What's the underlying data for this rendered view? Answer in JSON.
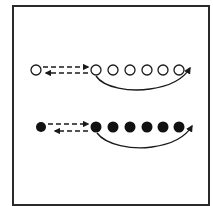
{
  "diagram": {
    "type": "drill-diagram",
    "rows": [
      {
        "name": "hollow-row",
        "style": "hollow",
        "leader": {
          "cx": 36,
          "cy": 70
        },
        "line": [
          {
            "cx": 96,
            "cy": 70
          },
          {
            "cx": 113,
            "cy": 70
          },
          {
            "cx": 130,
            "cy": 70
          },
          {
            "cx": 147,
            "cy": 70
          },
          {
            "cx": 163,
            "cy": 70
          },
          {
            "cx": 179,
            "cy": 70
          }
        ],
        "pass_arrows": "dashed-two-way",
        "run_arrow": "curved-return-to-end"
      },
      {
        "name": "filled-row",
        "style": "filled",
        "leader": {
          "cx": 41,
          "cy": 127
        },
        "line": [
          {
            "cx": 96,
            "cy": 127
          },
          {
            "cx": 113,
            "cy": 127
          },
          {
            "cx": 130,
            "cy": 127
          },
          {
            "cx": 147,
            "cy": 127
          },
          {
            "cx": 163,
            "cy": 127
          },
          {
            "cx": 179,
            "cy": 127
          }
        ],
        "pass_arrows": "dashed-two-way",
        "run_arrow": "curved-return-to-end"
      }
    ],
    "colors": {
      "stroke": "#1a1a1a",
      "frame": "#2a2a2a",
      "background": "#ffffff"
    }
  }
}
